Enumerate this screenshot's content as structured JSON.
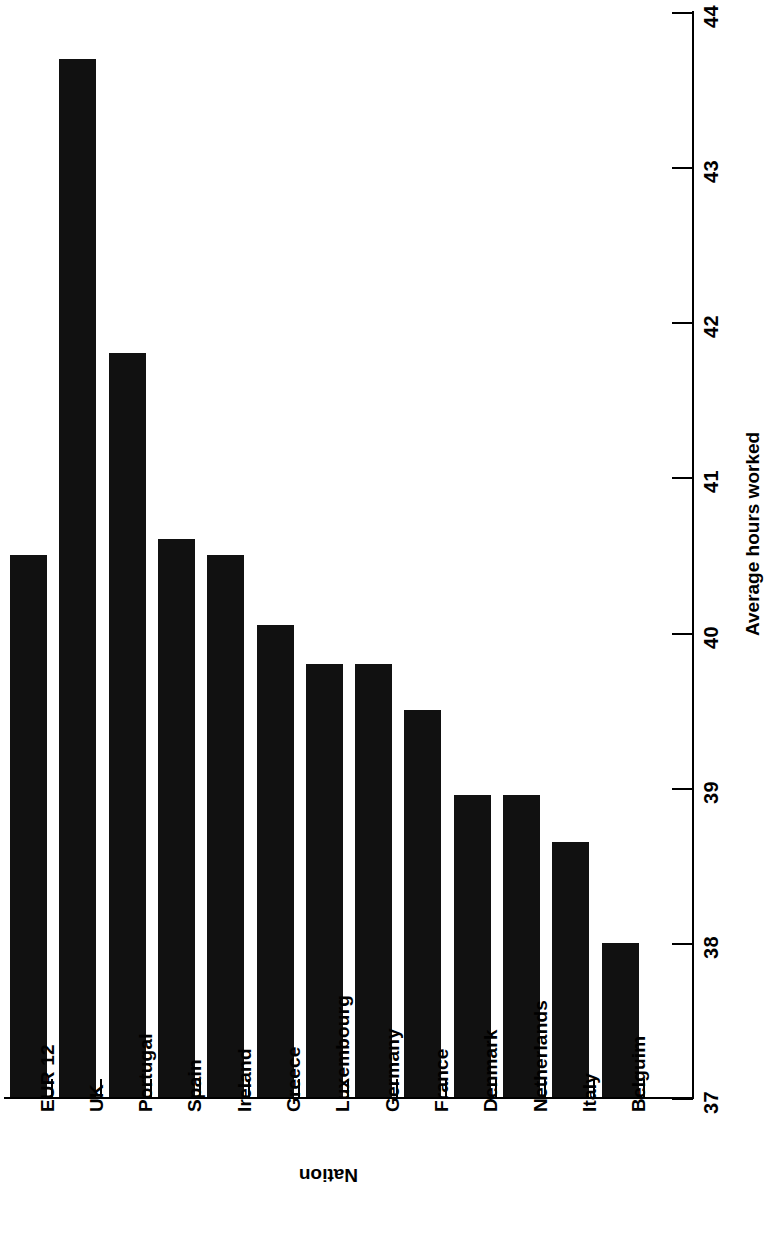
{
  "chart_data": {
    "type": "bar",
    "title": "",
    "subtitle": "",
    "orientation": "vertical-bars-rotated-90",
    "xlabel": "Nation",
    "ylabel": "Average hours worked",
    "categories": [
      "EUR 12",
      "UK",
      "Portugal",
      "Spain",
      "Ireland",
      "Greece",
      "Luxembourg",
      "Germany",
      "France",
      "Denmark",
      "Netherlands",
      "Italy",
      "Belguim"
    ],
    "values": [
      40.5,
      43.7,
      41.8,
      40.6,
      40.5,
      40.05,
      39.8,
      39.8,
      39.5,
      38.95,
      38.95,
      38.65,
      38.0
    ],
    "ylim": [
      37,
      44
    ],
    "ytick_labels": [
      "44",
      "43",
      "42",
      "41",
      "40",
      "39",
      "38",
      "37"
    ],
    "yticks": [
      44,
      43,
      42,
      41,
      40,
      39,
      38,
      37
    ],
    "grid": false,
    "legend": null,
    "legend_position": "none",
    "bar_color": "#111111",
    "axis_color": "#000000",
    "background_color": "#ffffff",
    "annotations": []
  },
  "axis_titles": {
    "category": "Nation",
    "value": "Average hours worked"
  }
}
